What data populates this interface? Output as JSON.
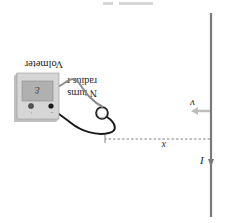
{
  "figure": {
    "orientation": "rotated-180",
    "caption_fragment": "",
    "wire": {
      "current_label": "I",
      "color": "#7a7a7a"
    },
    "velocity": {
      "label": "v",
      "color": "#bdbdbd"
    },
    "distance": {
      "label": "x"
    },
    "coil": {
      "label_line1": "N turns",
      "label_line2": "radius r"
    },
    "voltmeter": {
      "label": "Volmeter",
      "display": "ℰ",
      "plus": "+",
      "minus": "−",
      "body_color": "#d6d6d6",
      "screen_color": "#b0b0b0"
    },
    "leads": {
      "positive_color": "#8c8c8c",
      "negative_color": "#1a1a1a"
    }
  }
}
